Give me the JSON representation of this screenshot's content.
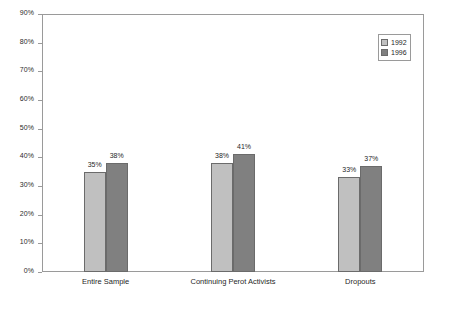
{
  "chart_data": {
    "type": "bar",
    "title": "",
    "subtitle": "",
    "xlabel": "",
    "ylabel": "",
    "categories": [
      "Entire Sample",
      "Continuing Perot Activists",
      "Dropouts"
    ],
    "series": [
      {
        "name": "1992",
        "values": [
          35,
          38,
          33
        ],
        "labels": [
          "35%",
          "38%",
          "33%"
        ],
        "color": "#c0c0c0"
      },
      {
        "name": "1996",
        "values": [
          38,
          41,
          37
        ],
        "labels": [
          "38%",
          "41%",
          "37%"
        ],
        "color": "#808080"
      }
    ],
    "ylim": [
      0,
      90
    ],
    "ytick_step": 10,
    "ytick_labels": [
      "0%",
      "10%",
      "20%",
      "30%",
      "40%",
      "50%",
      "60%",
      "70%",
      "80%",
      "90%"
    ],
    "ytick_values": [
      0,
      10,
      20,
      30,
      40,
      50,
      60,
      70,
      80,
      90
    ],
    "grid": false,
    "legend_position": "top-right",
    "plot_border_color": "#9a9a9a",
    "background_color": "#ffffff"
  },
  "legend": {
    "items": [
      {
        "label": "1992"
      },
      {
        "label": "1996"
      }
    ]
  }
}
